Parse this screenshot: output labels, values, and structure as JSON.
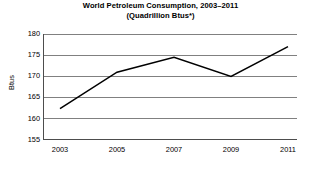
{
  "chart_data": {
    "type": "line",
    "title": "World Petroleum Consumption, 2003–2011",
    "subtitle": "(Quadrillion Btus*)",
    "xlabel": "",
    "ylabel": "Btus",
    "x": [
      2003,
      2005,
      2007,
      2009,
      2011
    ],
    "categories": [
      "2003",
      "2005",
      "2007",
      "2009",
      "2011"
    ],
    "values": [
      162.4,
      171.0,
      174.5,
      170.0,
      177.0
    ],
    "series": [
      {
        "name": "World Petroleum Consumption",
        "values": [
          162.4,
          171.0,
          174.5,
          170.0,
          177.0
        ]
      }
    ],
    "xlim": [
      2002,
      2012
    ],
    "ylim": [
      155,
      180
    ],
    "y_ticks": [
      155,
      160,
      165,
      170,
      175,
      180
    ],
    "y_tick_labels": [
      "155",
      "160",
      "165",
      "170",
      "175",
      "180"
    ],
    "x_ticks": [
      2003,
      2005,
      2007,
      2009,
      2011
    ],
    "x_tick_labels": [
      "2003",
      "2005",
      "2007",
      "2009",
      "2011"
    ],
    "grid": "horizontal",
    "legend": "none",
    "line_color": "#000000",
    "grid_color": "#808080",
    "axis_color": "#4d4d4d",
    "background_color": "#ffffff"
  }
}
